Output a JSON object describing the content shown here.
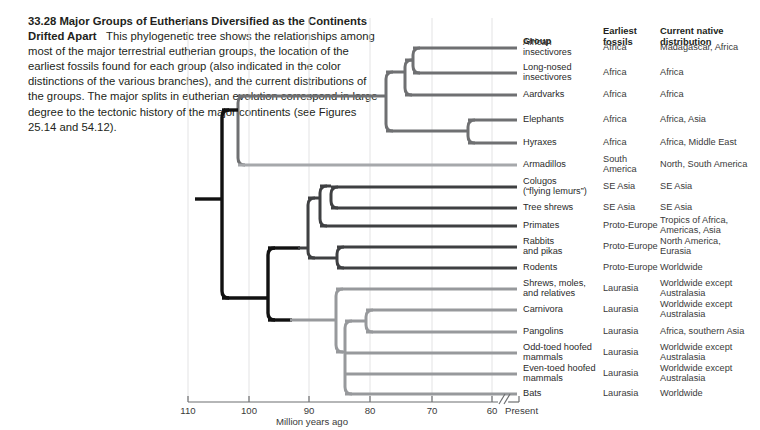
{
  "caption": {
    "number": "33.28",
    "headline": "Major Groups of Eutherians Diversified as the Continents Drifted Apart",
    "body": "This phylogenetic tree shows the relationships among most of the major terrestrial eutherian groups, the location of the earliest fossils found for each group (also indicated in the color distinctions of the various branches), and the current distributions of the groups. The major splits in eutherian evolution correspond in large degree to the tectonic history of the major continents (see Figures 25.14 and 54.12)."
  },
  "table": {
    "headers": {
      "group": "Group",
      "fossils": "Earliest\nfossils",
      "fossils_l1": "Earliest",
      "fossils_l2": "fossils",
      "distribution_l1": "Current native",
      "distribution_l2": "distribution"
    },
    "rows": [
      {
        "group_l1": "African",
        "group_l2": "insectivores",
        "fossils_l1": "Africa",
        "fossils_l2": "",
        "dist_l1": "Madagascar, Africa",
        "dist_l2": ""
      },
      {
        "group_l1": "Long-nosed",
        "group_l2": "insectivores",
        "fossils_l1": "Africa",
        "fossils_l2": "",
        "dist_l1": "Africa",
        "dist_l2": ""
      },
      {
        "group_l1": "Aardvarks",
        "group_l2": "",
        "fossils_l1": "Africa",
        "fossils_l2": "",
        "dist_l1": "Africa",
        "dist_l2": ""
      },
      {
        "group_l1": "Elephants",
        "group_l2": "",
        "fossils_l1": "Africa",
        "fossils_l2": "",
        "dist_l1": "Africa, Asia",
        "dist_l2": ""
      },
      {
        "group_l1": "Hyraxes",
        "group_l2": "",
        "fossils_l1": "Africa",
        "fossils_l2": "",
        "dist_l1": "Africa, Middle East",
        "dist_l2": ""
      },
      {
        "group_l1": "Armadillos",
        "group_l2": "",
        "fossils_l1": "South",
        "fossils_l2": "America",
        "dist_l1": "North, South America",
        "dist_l2": ""
      },
      {
        "group_l1": "Colugos",
        "group_l2": "(“flying lemurs”)",
        "fossils_l1": "SE Asia",
        "fossils_l2": "",
        "dist_l1": "SE Asia",
        "dist_l2": ""
      },
      {
        "group_l1": "Tree shrews",
        "group_l2": "",
        "fossils_l1": "SE Asia",
        "fossils_l2": "",
        "dist_l1": "SE Asia",
        "dist_l2": ""
      },
      {
        "group_l1": "Primates",
        "group_l2": "",
        "fossils_l1": "Proto-Europe",
        "fossils_l2": "",
        "dist_l1": "Tropics of Africa,",
        "dist_l2": "Americas, Asia"
      },
      {
        "group_l1": "Rabbits",
        "group_l2": "and pikas",
        "fossils_l1": "Proto-Europe",
        "fossils_l2": "",
        "dist_l1": "North America,",
        "dist_l2": "Eurasia"
      },
      {
        "group_l1": "Rodents",
        "group_l2": "",
        "fossils_l1": "Proto-Europe",
        "fossils_l2": "",
        "dist_l1": "Worldwide",
        "dist_l2": ""
      },
      {
        "group_l1": "Shrews, moles,",
        "group_l2": "and relatives",
        "fossils_l1": "Laurasia",
        "fossils_l2": "",
        "dist_l1": "Worldwide except",
        "dist_l2": "Australasia"
      },
      {
        "group_l1": "Carnivora",
        "group_l2": "",
        "fossils_l1": "Laurasia",
        "fossils_l2": "",
        "dist_l1": "Worldwide except",
        "dist_l2": "Australasia"
      },
      {
        "group_l1": "Pangolins",
        "group_l2": "",
        "fossils_l1": "Laurasia",
        "fossils_l2": "",
        "dist_l1": "Africa, southern Asia",
        "dist_l2": ""
      },
      {
        "group_l1": "Odd-toed hoofed",
        "group_l2": "mammals",
        "fossils_l1": "Laurasia",
        "fossils_l2": "",
        "dist_l1": "Worldwide except",
        "dist_l2": "Australasia"
      },
      {
        "group_l1": "Even-toed hoofed",
        "group_l2": "mammals",
        "fossils_l1": "Laurasia",
        "fossils_l2": "",
        "dist_l1": "Worldwide except",
        "dist_l2": "Australasia"
      },
      {
        "group_l1": "Bats",
        "group_l2": "",
        "fossils_l1": "Laurasia",
        "fossils_l2": "",
        "dist_l1": "Worldwide",
        "dist_l2": ""
      }
    ]
  },
  "axis": {
    "title": "Million years ago",
    "present": "Present",
    "ticks": [
      "110",
      "100",
      "90",
      "80",
      "70",
      "60"
    ],
    "tick_values": [
      110,
      100,
      90,
      80,
      70,
      60
    ],
    "tick_x": [
      188,
      249,
      309,
      370,
      432,
      492
    ],
    "break_x": 502,
    "present_x": 515
  },
  "colors": {
    "root_black": "#111111",
    "afrotheria_gray": "#6f7072",
    "xenarthra_light": "#a6a8ab",
    "euarchontoglires_dark": "#3f4042",
    "laurasiatheria_gray": "#97999c",
    "gridline": "#e3e3e4",
    "axis": "#6d6e70",
    "text": "#231f20"
  },
  "chart_data": {
    "type": "phylogenetic-tree",
    "title": "Major Groups of Eutherians Diversified as the Continents Drifted Apart",
    "xlabel": "Million years ago",
    "xlim": [
      112,
      58
    ],
    "axis_direction": "reversed",
    "leaf_rows_y": [
      48,
      73,
      95,
      120,
      143,
      165,
      187,
      208,
      226,
      247,
      268,
      289,
      310,
      332,
      353,
      374,
      394
    ],
    "root_age": 112,
    "clades": [
      {
        "name": "Eutheria root",
        "x": 205,
        "color": "root_black"
      },
      {
        "name": "Atlantogenata",
        "x": 222,
        "color": "root_black"
      },
      {
        "name": "Afrotheria",
        "x": 386,
        "color": "afrotheria_gray"
      },
      {
        "name": "Afroinsectiphilia",
        "x": 405,
        "color": "afrotheria_gray"
      },
      {
        "name": "Afrosoricida+Macroscelidea",
        "x": 413,
        "color": "afrotheria_gray"
      },
      {
        "name": "Paenungulata",
        "x": 468,
        "color": "afrotheria_gray"
      },
      {
        "name": "Boreoeutheria",
        "x": 268,
        "color": "root_black"
      },
      {
        "name": "Euarchontoglires",
        "x": 308,
        "color": "euarchontoglires_dark"
      },
      {
        "name": "Euarchonta",
        "x": 320,
        "color": "euarchontoglires_dark"
      },
      {
        "name": "Colugos+Treeshrews",
        "x": 331,
        "color": "euarchontoglires_dark"
      },
      {
        "name": "Glires",
        "x": 337,
        "color": "euarchontoglires_dark"
      },
      {
        "name": "Laurasiatheria",
        "x": 336,
        "color": "laurasiatheria_gray"
      },
      {
        "name": "Scrotifera",
        "x": 345,
        "color": "laurasiatheria_gray"
      },
      {
        "name": "Ferae",
        "x": 366,
        "color": "laurasiatheria_gray"
      }
    ]
  }
}
